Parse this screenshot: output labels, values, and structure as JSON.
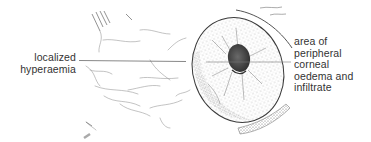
{
  "diagram": {
    "labels": {
      "left": {
        "lines": [
          "localized",
          "hyperaemia"
        ]
      },
      "right": {
        "lines": [
          "area of",
          "peripheral",
          "corneal",
          "oedema and",
          "infiltrate"
        ]
      }
    },
    "colors": {
      "ink": "#333333",
      "stipple": "#555555",
      "pupil": "#3a3a3a",
      "background": "#ffffff"
    }
  }
}
